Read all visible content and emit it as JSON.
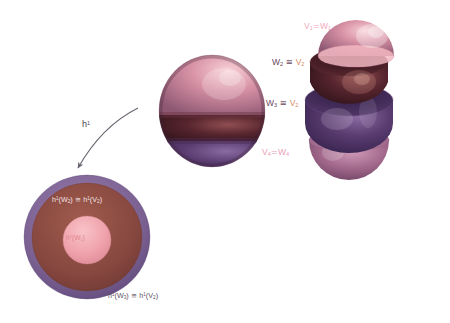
{
  "figure": {
    "map_label_prefix": "h",
    "map_label_sup": "1"
  },
  "stack_labels": [
    {
      "id": "v1w1",
      "left": "V",
      "left_sub": "1",
      "rel": "=",
      "right": "W",
      "right_sub": "1",
      "color": "#f2a9bd"
    },
    {
      "id": "w2v2",
      "left": "W",
      "left_sub": "2",
      "rel": "≅",
      "right": "V",
      "right_sub": "2",
      "color": "#6b4660",
      "right_color": "#d98b63"
    },
    {
      "id": "w3v2",
      "left": "W",
      "left_sub": "3",
      "rel": "≅",
      "right": "V",
      "right_sub": "2",
      "color": "#6b4660",
      "right_color": "#d98b63"
    },
    {
      "id": "v4w4",
      "left": "V",
      "left_sub": "4",
      "rel": "=",
      "right": "W",
      "right_sub": "4",
      "color": "#e8a0b8"
    }
  ],
  "disc_labels": {
    "top": {
      "fn": "h",
      "sup": "1",
      "arg1": "W",
      "arg1_sub": "2",
      "rel": "≅",
      "arg2": "V",
      "arg2_sub": "2"
    },
    "inner": {
      "fn": "h",
      "sup": "1",
      "arg": "W",
      "arg_sub": "1"
    },
    "bottom": {
      "fn": "h",
      "sup": "1",
      "arg1": "W",
      "arg1_sub": "3",
      "rel": "≅",
      "arg2": "V",
      "arg2_sub": "2"
    }
  },
  "colors": {
    "pink_cap": "#e8909f",
    "pink_cap_light": "#f6c3cc",
    "maroon_band": "#4a1f28",
    "maroon_band_light": "#8d4a50",
    "purple_band": "#54376b",
    "purple_band_light": "#7d5f92",
    "lower_pink": "#a76a8e",
    "disc_ring": "#7e6396",
    "disc_mid": "#8d4a41",
    "disc_inner": "#f0a3ad",
    "arrow": "#6b6470",
    "background": "#ffffff"
  }
}
